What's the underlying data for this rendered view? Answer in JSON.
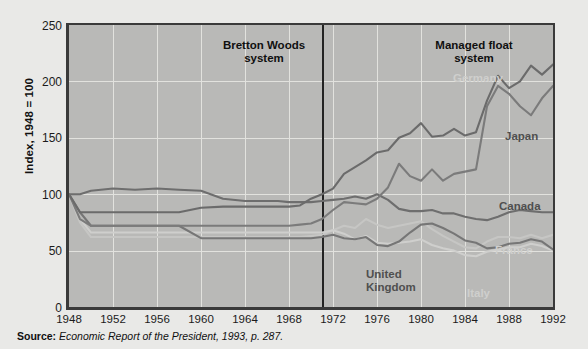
{
  "axes": {
    "y_title": "Index, 1948 = 100",
    "y_ticks": [
      "0",
      "50",
      "100",
      "150",
      "200",
      "250"
    ],
    "x_ticks": [
      "1948",
      "1952",
      "1956",
      "1960",
      "1964",
      "1968",
      "1972",
      "1976",
      "1980",
      "1984",
      "1988",
      "1992"
    ]
  },
  "annotations": {
    "era_left": "Bretton Woods\nsystem",
    "era_right": "Managed float\nsystem",
    "divider_year": 1971
  },
  "series_labels": {
    "germany": "Germany",
    "japan": "Japan",
    "canada": "Canada",
    "france": "France",
    "united_kingdom": "United\nKingdom",
    "italy": "Italy"
  },
  "source": {
    "label": "Source:",
    "text": "Economic Report of the President, 1993, p. 287."
  },
  "colors": {
    "page_background": "#e9e9e7",
    "plot_background": "#b9b9b7",
    "gridline": "#e2e2de",
    "axis": "#3a3a3a",
    "divider": "#232323",
    "series_dark": "#6b6b6b",
    "series_mid": "#8e8e8e",
    "series_light": "#c6c6c4",
    "label_dark": "#4f4f4f",
    "label_light": "#cfcfcd"
  },
  "chart_data": {
    "type": "line",
    "title": "",
    "subtitle": "",
    "xlabel": "",
    "ylabel": "Index, 1948 = 100",
    "xlim": [
      1948,
      1992
    ],
    "ylim": [
      0,
      250
    ],
    "grid": true,
    "legend": "inline-labels",
    "x": [
      1948,
      1949,
      1950,
      1952,
      1954,
      1956,
      1958,
      1960,
      1962,
      1964,
      1966,
      1967,
      1968,
      1969,
      1970,
      1971,
      1972,
      1973,
      1974,
      1975,
      1976,
      1977,
      1978,
      1979,
      1980,
      1981,
      1982,
      1983,
      1984,
      1985,
      1986,
      1987,
      1988,
      1989,
      1990,
      1991,
      1992
    ],
    "series": [
      {
        "name": "Germany",
        "color": "#6b6b6b",
        "values": [
          100,
          84,
          84,
          84,
          84,
          84,
          84,
          88,
          89,
          89,
          89,
          89,
          89,
          90,
          96,
          100,
          105,
          118,
          124,
          130,
          137,
          139,
          150,
          154,
          163,
          151,
          152,
          158,
          152,
          155,
          183,
          205,
          194,
          200,
          214,
          206,
          215
        ]
      },
      {
        "name": "Japan",
        "color": "#7b7b7b",
        "values": [
          100,
          78,
          72,
          72,
          72,
          72,
          72,
          72,
          72,
          72,
          72,
          72,
          72,
          73,
          74,
          78,
          86,
          93,
          92,
          91,
          96,
          106,
          127,
          116,
          112,
          122,
          112,
          118,
          120,
          122,
          178,
          196,
          189,
          178,
          170,
          185,
          196
        ]
      },
      {
        "name": "Canada",
        "color": "#6e6e6e",
        "values": [
          100,
          100,
          103,
          105,
          104,
          105,
          104,
          103,
          96,
          94,
          94,
          94,
          93,
          93,
          93,
          94,
          95,
          96,
          98,
          96,
          100,
          95,
          87,
          85,
          85,
          86,
          83,
          83,
          80,
          78,
          77,
          80,
          84,
          86,
          85,
          84,
          84
        ]
      },
      {
        "name": "France",
        "color": "#c6c6c4",
        "values": [
          100,
          75,
          62,
          62,
          62,
          62,
          62,
          62,
          62,
          62,
          62,
          62,
          62,
          62,
          63,
          64,
          68,
          72,
          70,
          78,
          73,
          70,
          72,
          74,
          76,
          69,
          63,
          58,
          53,
          52,
          58,
          62,
          62,
          61,
          64,
          61,
          64
        ]
      },
      {
        "name": "United Kingdom",
        "color": "#767676",
        "values": [
          100,
          84,
          72,
          72,
          72,
          72,
          72,
          61,
          61,
          61,
          61,
          61,
          61,
          61,
          61,
          62,
          64,
          61,
          60,
          62,
          55,
          54,
          58,
          66,
          73,
          74,
          70,
          65,
          59,
          57,
          52,
          53,
          56,
          57,
          60,
          58,
          51
        ]
      },
      {
        "name": "Italy",
        "color": "#cfcfcd",
        "values": [
          100,
          78,
          66,
          66,
          66,
          66,
          66,
          66,
          66,
          66,
          66,
          66,
          66,
          66,
          66,
          66,
          68,
          65,
          60,
          63,
          57,
          56,
          57,
          58,
          60,
          55,
          52,
          50,
          46,
          45,
          49,
          51,
          53,
          53,
          56,
          54,
          50
        ]
      }
    ]
  }
}
